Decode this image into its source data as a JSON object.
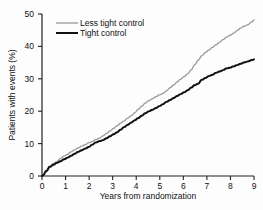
{
  "chart_data": {
    "type": "line",
    "title": "",
    "subtitle": "",
    "xlabel": "Years from randomization",
    "ylabel": "Patients with events (%)",
    "xlim": [
      0,
      9
    ],
    "ylim": [
      0,
      50
    ],
    "xticks": [
      "0",
      "1",
      "2",
      "3",
      "4",
      "5",
      "6",
      "7",
      "8",
      "9"
    ],
    "yticks": [
      "0",
      "10",
      "20",
      "30",
      "40",
      "50"
    ],
    "grid": false,
    "legend_position": "top-left",
    "colors": {
      "less_tight_control": "#9a9a9a",
      "tight_control": "#111111",
      "axis": "#222222",
      "background": "#fdfdfd"
    },
    "series": [
      {
        "name": "Less tight control",
        "color": "#9a9a9a",
        "x": [
          0,
          0.15,
          0.3,
          0.45,
          0.6,
          0.75,
          0.9,
          1.05,
          1.2,
          1.35,
          1.5,
          1.65,
          1.8,
          1.95,
          2.1,
          2.25,
          2.4,
          2.55,
          2.7,
          2.85,
          3.0,
          3.15,
          3.3,
          3.45,
          3.6,
          3.75,
          3.9,
          4.05,
          4.2,
          4.35,
          4.5,
          4.65,
          4.8,
          4.95,
          5.1,
          5.25,
          5.4,
          5.55,
          5.7,
          5.85,
          6.0,
          6.15,
          6.3,
          6.45,
          6.6,
          6.75,
          6.9,
          7.05,
          7.2,
          7.35,
          7.5,
          7.65,
          7.8,
          7.95,
          8.1,
          8.25,
          8.4,
          8.55,
          8.7,
          8.85,
          9.0
        ],
        "y": [
          0,
          1.2,
          2.6,
          3.8,
          4.4,
          5.3,
          6.1,
          6.6,
          7.4,
          8.0,
          8.6,
          9.2,
          9.6,
          10.2,
          10.6,
          11.2,
          11.6,
          12.3,
          13.0,
          13.8,
          14.6,
          15.4,
          16.2,
          16.9,
          17.8,
          18.5,
          19.4,
          20.5,
          21.4,
          22.4,
          23.2,
          23.8,
          24.4,
          25.0,
          25.4,
          26.2,
          27.1,
          28.0,
          28.9,
          29.8,
          30.6,
          31.4,
          32.6,
          34.2,
          35.6,
          37.0,
          38.0,
          38.8,
          39.6,
          40.4,
          41.2,
          42.0,
          42.8,
          43.4,
          44.0,
          44.8,
          45.6,
          46.2,
          46.6,
          47.4,
          48.2
        ]
      },
      {
        "name": "Tight control",
        "color": "#111111",
        "x": [
          0,
          0.15,
          0.3,
          0.45,
          0.6,
          0.75,
          0.9,
          1.05,
          1.2,
          1.35,
          1.5,
          1.65,
          1.8,
          1.95,
          2.1,
          2.25,
          2.4,
          2.55,
          2.7,
          2.85,
          3.0,
          3.15,
          3.3,
          3.45,
          3.6,
          3.75,
          3.9,
          4.05,
          4.2,
          4.35,
          4.5,
          4.65,
          4.8,
          4.95,
          5.1,
          5.25,
          5.4,
          5.55,
          5.7,
          5.85,
          6.0,
          6.15,
          6.3,
          6.45,
          6.6,
          6.75,
          6.9,
          7.05,
          7.2,
          7.35,
          7.5,
          7.65,
          7.8,
          7.95,
          8.1,
          8.25,
          8.4,
          8.55,
          8.7,
          8.85,
          9.0
        ],
        "y": [
          0,
          1.4,
          2.8,
          3.4,
          4.0,
          4.5,
          5.1,
          5.6,
          6.2,
          6.8,
          7.4,
          7.9,
          8.4,
          8.9,
          9.6,
          10.3,
          10.7,
          11.0,
          11.6,
          12.2,
          12.8,
          13.4,
          14.2,
          15.0,
          15.7,
          16.4,
          17.1,
          17.8,
          18.5,
          19.3,
          19.9,
          20.4,
          20.9,
          21.5,
          22.1,
          22.8,
          23.4,
          24.0,
          24.6,
          25.2,
          25.8,
          26.4,
          27.2,
          28.0,
          28.4,
          29.6,
          30.2,
          30.8,
          31.2,
          31.8,
          32.2,
          32.6,
          33.2,
          33.4,
          33.8,
          34.2,
          34.6,
          35.0,
          35.3,
          35.7,
          36.0
        ]
      }
    ],
    "legend": [
      {
        "label": "Less tight control",
        "color": "#9a9a9a"
      },
      {
        "label": "Tight control",
        "color": "#111111"
      }
    ]
  }
}
